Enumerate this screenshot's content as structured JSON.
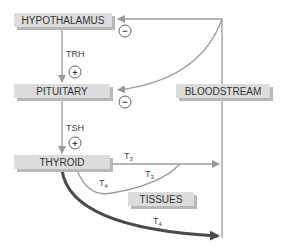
{
  "diagram": {
    "nodes": {
      "hypothalamus": "HYPOTHALAMUS",
      "pituitary": "PITUITARY",
      "thyroid": "THYROID",
      "bloodstream": "BLOODSTREAM",
      "tissues": "TISSUES"
    },
    "edge_labels": {
      "trh": "TRH",
      "tsh": "TSH",
      "t3_main": "T",
      "t3_main_sub": "3",
      "t3_tissue": "T",
      "t3_tissue_sub": "3",
      "t4_tissue": "T",
      "t4_tissue_sub": "4",
      "t4_main": "T",
      "t4_main_sub": "4"
    },
    "signs": {
      "stim_trh": "+",
      "stim_tsh": "+",
      "inhib_hypothalamus": "−",
      "inhib_pituitary": "−"
    },
    "colors": {
      "box_fill": "#dcdcdc",
      "box_shadow": "#b8b8b8",
      "line": "#999999",
      "thick_arrow": "#4a4a4a",
      "text": "#333333"
    }
  }
}
